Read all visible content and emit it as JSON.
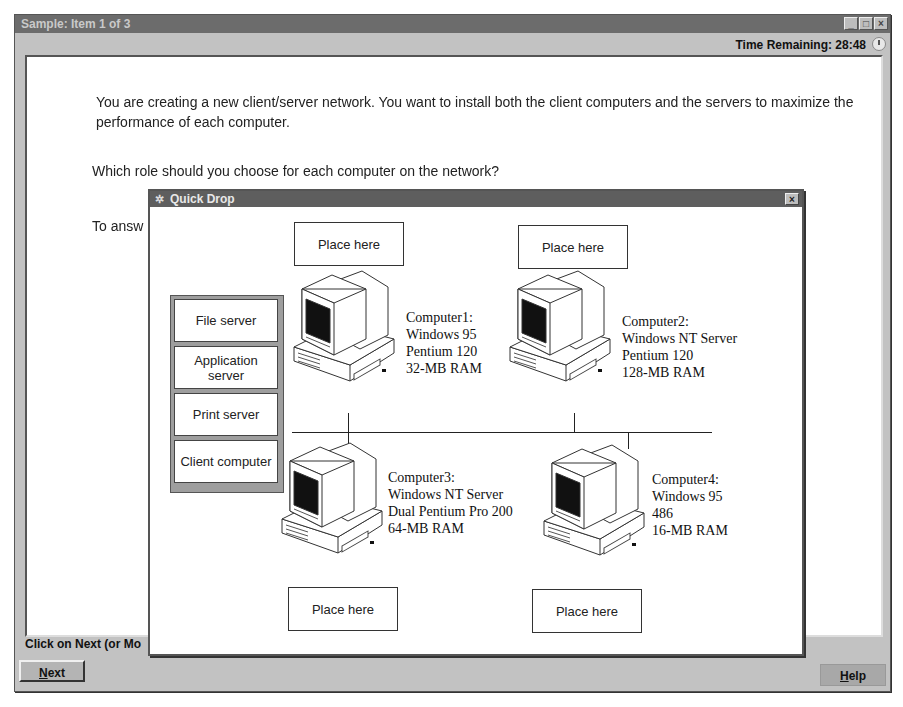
{
  "window": {
    "title": "Sample: Item 1 of 3",
    "controls": {
      "minimize": "_",
      "maximize": "□",
      "close": "×"
    },
    "time_remaining_label": "Time Remaining: 28:48",
    "clock_icon": "clock-icon"
  },
  "question": {
    "paragraph1": "You are creating a new client/server network. You want to install both the client computers and the servers to maximize the performance of each computer.",
    "paragraph2": "Which role should you choose for each computer on the network?",
    "paragraph3_visible": "To answ"
  },
  "footer": {
    "status_visible": "Click on Next (or Mo",
    "next_button": {
      "mnemonic": "N",
      "rest": "ext"
    },
    "help_button": {
      "mnemonic": "H",
      "rest": "elp"
    }
  },
  "quick_drop": {
    "title": "Quick Drop",
    "title_icon": "gear-icon",
    "close": "×",
    "palette": [
      {
        "label": "File server"
      },
      {
        "label": "Application server"
      },
      {
        "label": "Print server"
      },
      {
        "label": "Client computer"
      }
    ],
    "drop_targets": [
      {
        "label": "Place here",
        "for": "Computer1"
      },
      {
        "label": "Place here",
        "for": "Computer2"
      },
      {
        "label": "Place here",
        "for": "Computer3"
      },
      {
        "label": "Place here",
        "for": "Computer4"
      }
    ],
    "computers": [
      {
        "name": "Computer1:",
        "os": "Windows 95",
        "cpu": "Pentium 120",
        "ram": "32-MB  RAM"
      },
      {
        "name": "Computer2:",
        "os": "Windows NT Server",
        "cpu": "Pentium 120",
        "ram": "128-MB RAM"
      },
      {
        "name": "Computer3:",
        "os": "Windows NT Server",
        "cpu": "Dual Pentium Pro 200",
        "ram": "64-MB RAM"
      },
      {
        "name": "Computer4:",
        "os": "Windows 95",
        "cpu": "486",
        "ram": "16-MB RAM"
      }
    ]
  }
}
